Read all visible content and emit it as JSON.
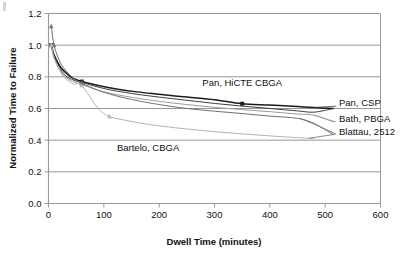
{
  "chart_data": {
    "type": "line",
    "title": "",
    "xlabel": "Dwell Time (minutes)",
    "ylabel": "Normalized Time to Failure",
    "xlim": [
      0,
      600
    ],
    "ylim": [
      0,
      1.2
    ],
    "xticks": [
      0,
      100,
      200,
      300,
      400,
      500,
      600
    ],
    "xtick_labels": [
      "0",
      "100",
      "200",
      "300",
      "400",
      "500",
      "600"
    ],
    "yticks": [
      0.0,
      0.2,
      0.4,
      0.6,
      0.8,
      1.0,
      1.2
    ],
    "ytick_labels": [
      "0.0",
      "0.2",
      "0.4",
      "0.6",
      "0.8",
      "1.0",
      "1.2"
    ],
    "grid": "horizontal",
    "legend": "inline-labels",
    "series": [
      {
        "name": "Pan, HiCTE CBGA",
        "color": "#1a1a1a",
        "label_x": 350,
        "label_y": 0.74,
        "points": [
          [
            5,
            1.0
          ],
          [
            10,
            0.94
          ],
          [
            20,
            0.87
          ],
          [
            30,
            0.83
          ],
          [
            45,
            0.79
          ],
          [
            60,
            0.77
          ],
          [
            90,
            0.745
          ],
          [
            120,
            0.725
          ],
          [
            160,
            0.705
          ],
          [
            200,
            0.69
          ],
          [
            250,
            0.672
          ],
          [
            300,
            0.655
          ],
          [
            350,
            0.63
          ],
          [
            400,
            0.622
          ],
          [
            450,
            0.612
          ],
          [
            480,
            0.606
          ],
          [
            515,
            0.6
          ]
        ],
        "markers": [
          [
            5,
            1.0
          ],
          [
            60,
            0.77
          ],
          [
            350,
            0.63
          ]
        ]
      },
      {
        "name": "Pan, CSP",
        "color": "#3d3d3d",
        "label_x": 525,
        "label_y": 0.615,
        "points": [
          [
            5,
            1.0
          ],
          [
            10,
            0.93
          ],
          [
            20,
            0.86
          ],
          [
            30,
            0.81
          ],
          [
            45,
            0.78
          ],
          [
            60,
            0.765
          ],
          [
            90,
            0.735
          ],
          [
            120,
            0.712
          ],
          [
            160,
            0.69
          ],
          [
            200,
            0.672
          ],
          [
            250,
            0.652
          ],
          [
            300,
            0.632
          ],
          [
            350,
            0.615
          ],
          [
            400,
            0.6
          ],
          [
            450,
            0.585
          ],
          [
            480,
            0.577
          ],
          [
            515,
            0.6
          ]
        ],
        "markers": [
          [
            5,
            1.0
          ],
          [
            60,
            0.765
          ]
        ]
      },
      {
        "name": "Bath, PBGA",
        "color": "#9a9a9a",
        "label_x": 525,
        "label_y": 0.515,
        "points": [
          [
            5,
            1.0
          ],
          [
            10,
            0.92
          ],
          [
            20,
            0.85
          ],
          [
            30,
            0.8
          ],
          [
            45,
            0.77
          ],
          [
            60,
            0.752
          ],
          [
            90,
            0.715
          ],
          [
            120,
            0.69
          ],
          [
            160,
            0.665
          ],
          [
            200,
            0.645
          ],
          [
            250,
            0.625
          ],
          [
            300,
            0.607
          ],
          [
            350,
            0.593
          ],
          [
            400,
            0.58
          ],
          [
            450,
            0.565
          ],
          [
            480,
            0.558
          ],
          [
            515,
            0.515
          ]
        ],
        "markers": [
          [
            5,
            1.0
          ],
          [
            60,
            0.752
          ]
        ]
      },
      {
        "name": "Blattau, 2512",
        "color": "#707070",
        "label_x": 525,
        "label_y": 0.435,
        "points": [
          [
            5,
            1.12
          ],
          [
            10,
            1.0
          ],
          [
            20,
            0.9
          ],
          [
            30,
            0.845
          ],
          [
            45,
            0.79
          ],
          [
            60,
            0.76
          ],
          [
            90,
            0.715
          ],
          [
            120,
            0.682
          ],
          [
            160,
            0.65
          ],
          [
            200,
            0.625
          ],
          [
            250,
            0.6
          ],
          [
            300,
            0.583
          ],
          [
            350,
            0.568
          ],
          [
            400,
            0.552
          ],
          [
            450,
            0.538
          ],
          [
            480,
            0.505
          ],
          [
            515,
            0.435
          ]
        ],
        "markers": [
          [
            5,
            1.12
          ],
          [
            10,
            1.0
          ],
          [
            60,
            0.76
          ]
        ]
      },
      {
        "name": "Bartelo, CBGA",
        "color": "#b4b4b4",
        "label_x": 180,
        "label_y": 0.33,
        "points": [
          [
            5,
            1.0
          ],
          [
            10,
            0.92
          ],
          [
            20,
            0.84
          ],
          [
            30,
            0.79
          ],
          [
            45,
            0.755
          ],
          [
            60,
            0.745
          ],
          [
            90,
            0.6
          ],
          [
            110,
            0.55
          ],
          [
            140,
            0.525
          ],
          [
            180,
            0.5
          ],
          [
            230,
            0.478
          ],
          [
            280,
            0.46
          ],
          [
            330,
            0.445
          ],
          [
            380,
            0.432
          ],
          [
            430,
            0.42
          ],
          [
            470,
            0.412
          ],
          [
            480,
            0.41
          ]
        ],
        "markers": [
          [
            5,
            1.0
          ],
          [
            60,
            0.745
          ],
          [
            110,
            0.55
          ]
        ]
      }
    ]
  },
  "axes": {
    "x_title": "Dwell Time (minutes)",
    "y_title": "Normalized Time to Failure"
  },
  "labels": {
    "pan_hicte_cbga": "Pan, HiCTE CBGA",
    "pan_csp": "Pan, CSP",
    "bath_pbga": "Bath, PBGA",
    "blattau_2512": "Blattau, 2512",
    "bartelo_cbga": "Bartelo, CBGA"
  },
  "ytick_values": [
    "0.0",
    "0.2",
    "0.4",
    "0.6",
    "0.8",
    "1.0",
    "1.2"
  ],
  "xtick_values": [
    "0",
    "100",
    "200",
    "300",
    "400",
    "500",
    "600"
  ],
  "colors": {
    "grid": "#8c8c8c",
    "frame": "#9a9a9a",
    "text": "#111111"
  }
}
